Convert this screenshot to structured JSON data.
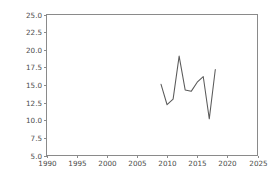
{
  "chart_data": {
    "type": "line",
    "title": "",
    "xlabel": "",
    "ylabel": "",
    "xlim": [
      1990,
      2025
    ],
    "ylim": [
      5.0,
      25.0
    ],
    "grid": false,
    "legend": null,
    "xticks": [
      1990,
      1995,
      2000,
      2005,
      2010,
      2015,
      2020,
      2025
    ],
    "xtick_labels": [
      "1990",
      "1995",
      "2000",
      "2005",
      "2010",
      "2015",
      "2020",
      "2025"
    ],
    "yticks": [
      5.0,
      7.5,
      10.0,
      12.5,
      15.0,
      17.5,
      20.0,
      22.5,
      25.0
    ],
    "ytick_labels": [
      "5.0",
      "7.5",
      "10.0",
      "12.5",
      "15.0",
      "17.5",
      "20.0",
      "22.5",
      "25.0"
    ],
    "x": [
      2009,
      2010,
      2011,
      2012,
      2013,
      2014,
      2015,
      2016,
      2017,
      2018
    ],
    "series": [
      {
        "name": "series-1",
        "color": "#5a5a5a",
        "values": [
          15.1,
          12.2,
          13.0,
          19.1,
          14.3,
          14.1,
          15.4,
          16.2,
          10.2,
          17.2
        ]
      }
    ]
  },
  "figure": {
    "background_color": "#ffffff",
    "axes_color": "#8a8a8a",
    "tick_label_color": "#4a4a4a"
  }
}
